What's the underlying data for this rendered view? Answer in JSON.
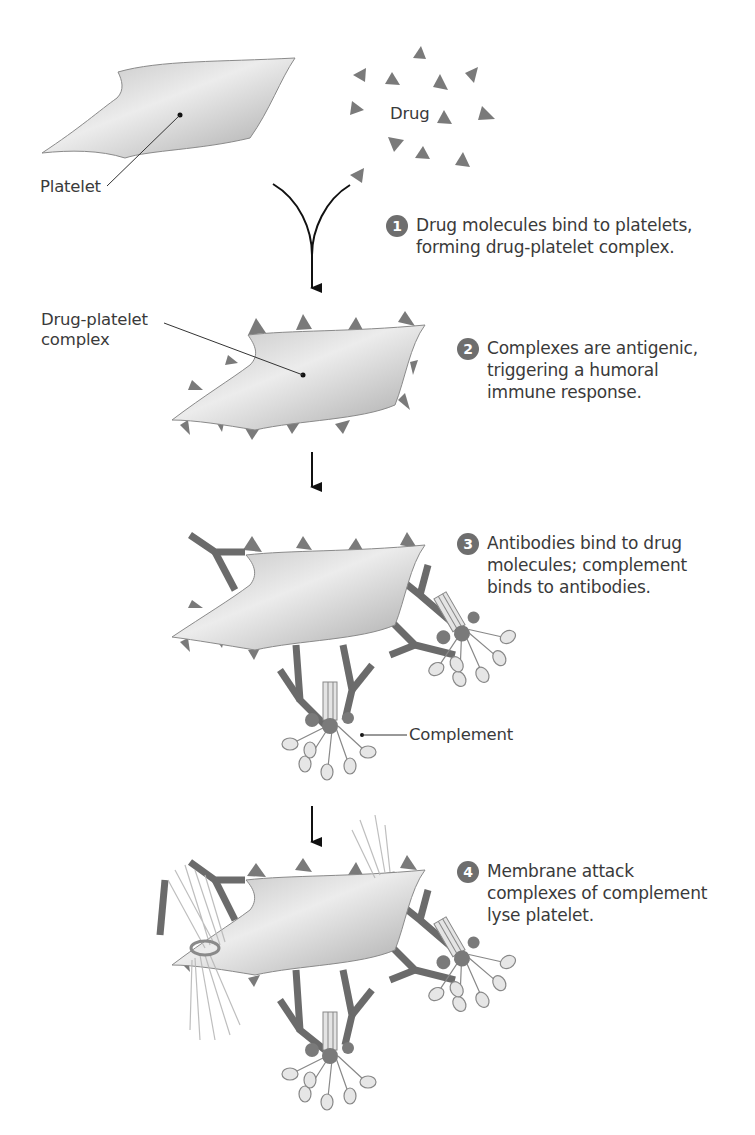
{
  "figure": {
    "labels": {
      "platelet": "Platelet",
      "drug": "Drug",
      "drug_platelet_complex": "Drug-platelet\ncomplex",
      "complement": "Complement"
    },
    "steps": [
      {
        "number": "1",
        "text": "Drug molecules bind to platelets,\nforming drug-platelet complex."
      },
      {
        "number": "2",
        "text": "Complexes are antigenic,\ntriggering a humoral\nimmune response."
      },
      {
        "number": "3",
        "text": "Antibodies bind to drug\nmolecules; complement\nbinds to antibodies."
      },
      {
        "number": "4",
        "text": "Membrane attack\ncomplexes of complement\nlyse platelet."
      }
    ],
    "colors": {
      "drug_triangle": "#7a7a7a",
      "platelet_fill": "#d4d4d4",
      "antibody": "#6b6b6b",
      "step_badge": "#6e6e6e",
      "text": "#3a3a3a"
    }
  }
}
